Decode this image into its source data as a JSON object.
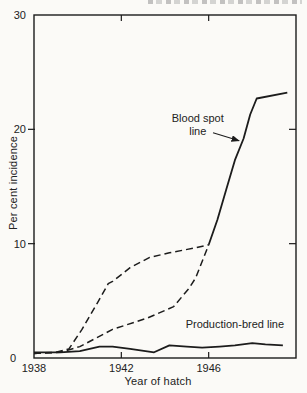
{
  "page": {
    "background": "#fbfaf7",
    "ink": "#1c1c1c"
  },
  "chart_data": {
    "type": "line",
    "xlabel": "Year of hatch",
    "ylabel": "Per cent incidence",
    "xlim": [
      1938,
      1950
    ],
    "ylim": [
      0,
      30
    ],
    "grid": false,
    "x_ticks": [
      {
        "value": 1938,
        "label": "1938"
      },
      {
        "value": 1942,
        "label": "1942"
      },
      {
        "value": 1946,
        "label": "1946"
      }
    ],
    "y_ticks": [
      {
        "value": 0,
        "label": "0"
      },
      {
        "value": 10,
        "label": "10"
      },
      {
        "value": 20,
        "label": "20"
      },
      {
        "value": 30,
        "label": "30"
      }
    ],
    "series": [
      {
        "name": "Blood spot line",
        "style": "solid",
        "x": [
          1946.0,
          1946.4,
          1946.8,
          1947.2,
          1947.6,
          1947.9,
          1948.2,
          1949.6
        ],
        "y": [
          9.9,
          12.1,
          14.7,
          17.3,
          19.2,
          21.3,
          22.7,
          23.2
        ]
      },
      {
        "name": "blood-spot-dashed-upper",
        "style": "dashed",
        "x": [
          1938.0,
          1939.0,
          1939.6,
          1940.2,
          1940.9,
          1941.4,
          1941.6,
          1942.4,
          1943.3,
          1944.2,
          1945.3,
          1946.0
        ],
        "y": [
          0.4,
          0.5,
          0.8,
          2.5,
          4.8,
          6.5,
          6.7,
          7.9,
          8.8,
          9.2,
          9.6,
          9.9
        ]
      },
      {
        "name": "blood-spot-dashed-lower",
        "style": "dashed",
        "x": [
          1938.0,
          1939.2,
          1940.1,
          1941.6,
          1943.2,
          1944.4,
          1945.1,
          1945.4,
          1946.0
        ],
        "y": [
          0.4,
          0.5,
          1.0,
          2.5,
          3.5,
          4.5,
          6.1,
          7.0,
          9.9
        ]
      },
      {
        "name": "Production-bred line",
        "style": "solid",
        "x": [
          1938.0,
          1939.2,
          1940.1,
          1941.0,
          1941.6,
          1942.4,
          1943.5,
          1944.2,
          1945.0,
          1945.7,
          1946.5,
          1947.2,
          1948.0,
          1948.6,
          1949.4
        ],
        "y": [
          0.5,
          0.5,
          0.6,
          1.0,
          1.0,
          0.8,
          0.5,
          1.1,
          1.0,
          0.9,
          1.0,
          1.1,
          1.3,
          1.2,
          1.1
        ]
      }
    ],
    "annotations": [
      {
        "name": "blood-spot-label",
        "text_lines": [
          "Blood spot",
          "line"
        ],
        "x": 1945.5,
        "y": 20.6,
        "arrow": {
          "x1": 1946.2,
          "y1": 19.7,
          "x2": 1947.4,
          "y2": 19.0
        }
      },
      {
        "name": "production-bred-label",
        "text_lines": [
          "Production-bred line"
        ],
        "x": 1947.2,
        "y": 2.6
      }
    ]
  }
}
